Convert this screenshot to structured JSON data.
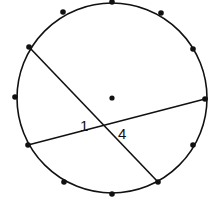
{
  "diagram": {
    "type": "circle with 12 equally spaced points and two intersecting chords",
    "circle": {
      "cx": 112,
      "cy": 98,
      "r": 95
    },
    "center_point": {
      "x": 112,
      "y": 98
    },
    "points": [
      {
        "x": 112,
        "y": 2
      },
      {
        "x": 161,
        "y": 13
      },
      {
        "x": 193,
        "y": 49
      },
      {
        "x": 205,
        "y": 99
      },
      {
        "x": 193,
        "y": 145
      },
      {
        "x": 158,
        "y": 182
      },
      {
        "x": 112,
        "y": 194
      },
      {
        "x": 64,
        "y": 182
      },
      {
        "x": 28,
        "y": 145
      },
      {
        "x": 15,
        "y": 97
      },
      {
        "x": 29,
        "y": 47
      },
      {
        "x": 63,
        "y": 12
      }
    ],
    "chords": [
      {
        "from": {
          "x": 29,
          "y": 47
        },
        "to": {
          "x": 158,
          "y": 182
        }
      },
      {
        "from": {
          "x": 28,
          "y": 145
        },
        "to": {
          "x": 205,
          "y": 99
        }
      }
    ],
    "angle_labels": [
      {
        "text": "1",
        "x": 80,
        "y": 131
      },
      {
        "text": "4",
        "x": 118,
        "y": 139
      }
    ],
    "stroke_color": "#111111"
  }
}
